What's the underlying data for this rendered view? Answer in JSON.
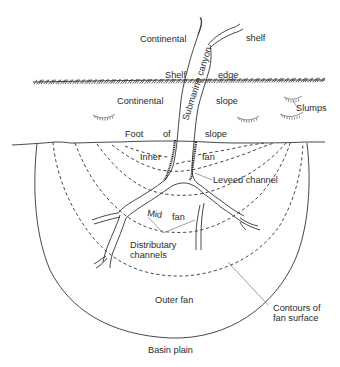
{
  "diagram": {
    "labels": {
      "continental_shelf_left": "Continental",
      "continental_shelf_right": "shelf",
      "submarine_canyon": "Submarine canyon",
      "shelf_edge_left": "Shelf",
      "shelf_edge_right": "edge",
      "continental_slope_left": "Continental",
      "continental_slope_right": "slope",
      "slumps": "Slumps",
      "foot_of_slope_1": "Foot",
      "foot_of_slope_2": "of",
      "foot_of_slope_3": "slope",
      "inner_fan_left": "Inner",
      "inner_fan_right": "fan",
      "leveed_channel": "Leveed channel",
      "mid_fan_left": "Mid",
      "mid_fan_right": "fan",
      "distributary_line1": "Distributary",
      "distributary_line2": "channels",
      "outer_fan": "Outer fan",
      "contours_line1": "Contours of",
      "contours_line2": "fan surface",
      "basin_plain": "Basin plain"
    },
    "colors": {
      "ink": "#2b2b2b",
      "leader": "#777777",
      "background": "#ffffff"
    }
  }
}
